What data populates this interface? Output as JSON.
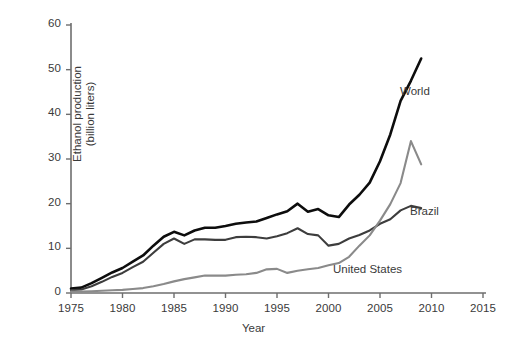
{
  "chart_data": {
    "type": "line",
    "title": "",
    "xlabel": "Year",
    "ylabel": "Ethanol production (billion liters)",
    "ylabel_line1": "Ethanol production",
    "ylabel_line2": "(billion liters)",
    "xlim": [
      1975,
      2015
    ],
    "ylim": [
      0,
      60
    ],
    "xticks": [
      1975,
      1980,
      1985,
      1990,
      1995,
      2000,
      2005,
      2010,
      2015
    ],
    "xtick_labels": [
      "1975",
      "1980",
      "1985",
      "1990",
      "1995",
      "2000",
      "2005",
      "2010",
      "2015"
    ],
    "yticks": [
      0,
      10,
      20,
      30,
      40,
      50,
      60
    ],
    "ytick_labels": [
      "0",
      "10",
      "20",
      "30",
      "40",
      "50",
      "60"
    ],
    "grid": false,
    "legend_position": "inline-annotations",
    "x": [
      1975,
      1976,
      1977,
      1978,
      1979,
      1980,
      1981,
      1982,
      1983,
      1984,
      1985,
      1986,
      1987,
      1988,
      1989,
      1990,
      1991,
      1992,
      1993,
      1994,
      1995,
      1996,
      1997,
      1998,
      1999,
      2000,
      2001,
      2002,
      2003,
      2004,
      2005,
      2006,
      2007,
      2008,
      2009
    ],
    "series": [
      {
        "name": "World",
        "color": "#0d0d0d",
        "values": [
          1.0,
          1.2,
          2.2,
          3.4,
          4.6,
          5.6,
          7.0,
          8.4,
          10.6,
          12.6,
          13.7,
          12.9,
          14.0,
          14.6,
          14.6,
          15.0,
          15.5,
          15.8,
          16.0,
          16.8,
          17.6,
          18.3,
          20.0,
          18.2,
          18.8,
          17.4,
          17.0,
          19.8,
          22.0,
          24.7,
          29.5,
          35.5,
          43.0,
          47.5,
          52.5
        ]
      },
      {
        "name": "Brazil",
        "color": "#3d3d3d",
        "values": [
          0.6,
          0.8,
          1.5,
          2.5,
          3.6,
          4.5,
          5.8,
          7.0,
          9.0,
          11.0,
          12.2,
          11.0,
          12.0,
          12.0,
          11.9,
          11.9,
          12.5,
          12.6,
          12.5,
          12.2,
          12.7,
          13.4,
          14.5,
          13.2,
          12.9,
          10.6,
          11.0,
          12.2,
          13.0,
          14.0,
          15.5,
          16.5,
          18.5,
          19.5,
          19.0
        ]
      },
      {
        "name": "United States",
        "color": "#8a8a8a",
        "values": [
          0.3,
          0.3,
          0.4,
          0.5,
          0.6,
          0.7,
          0.9,
          1.1,
          1.5,
          2.0,
          2.6,
          3.1,
          3.5,
          3.9,
          3.9,
          3.9,
          4.1,
          4.2,
          4.5,
          5.3,
          5.4,
          4.5,
          5.0,
          5.3,
          5.6,
          6.2,
          6.7,
          8.1,
          10.6,
          12.9,
          16.2,
          19.9,
          24.6,
          34.0,
          28.8
        ]
      }
    ]
  },
  "annotations": {
    "world_label": "World",
    "brazil_label": "Brazil",
    "us_label": "United States"
  }
}
